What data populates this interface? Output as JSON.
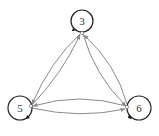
{
  "diagram": {
    "type": "directed-graph",
    "colors": {
      "node_stroke": "#222222",
      "node_fill": "#ffffff",
      "edge": "#8a8a8a",
      "label": "#333333"
    },
    "nodes": [
      {
        "id": "n3",
        "label": "3",
        "cx": 82,
        "cy": 21,
        "r": 11
      },
      {
        "id": "n5",
        "label": "5",
        "cx": 20,
        "cy": 108,
        "r": 12
      },
      {
        "id": "n6",
        "label": "6",
        "cx": 139,
        "cy": 108,
        "r": 12
      }
    ],
    "edges": [
      {
        "from": "3",
        "to": "5"
      },
      {
        "from": "5",
        "to": "3"
      },
      {
        "from": "3",
        "to": "6"
      },
      {
        "from": "6",
        "to": "3"
      },
      {
        "from": "5",
        "to": "6"
      },
      {
        "from": "6",
        "to": "5"
      }
    ]
  }
}
